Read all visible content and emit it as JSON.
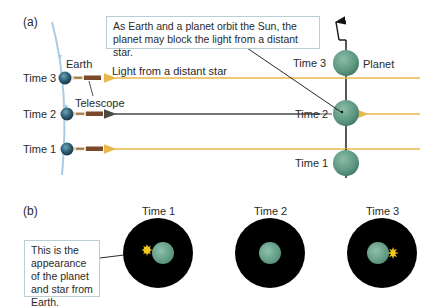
{
  "panels": {
    "a": {
      "label": "(a)",
      "callout": "As Earth and a planet orbit the Sun, the planet may block the light from a distant star.",
      "earth_label": "Earth",
      "telescope_label": "Telescope",
      "light_label": "Light from a distant star",
      "planet_label": "Planet",
      "earth_times": [
        "Time 3",
        "Time 2",
        "Time 1"
      ],
      "planet_times": [
        "Time 3",
        "Time 2",
        "Time 1"
      ]
    },
    "b": {
      "label": "(b)",
      "callout": "This is the appearance of the planet and star from Earth.",
      "views": [
        {
          "time": "Time 1",
          "star_position": "left"
        },
        {
          "time": "Time 2",
          "star_position": "hidden"
        },
        {
          "time": "Time 3",
          "star_position": "right"
        }
      ]
    }
  },
  "colors": {
    "light_ray": "#e8b84a",
    "blocked_ray": "#5a5a52",
    "earth_orbit": "#a9cde6",
    "planet": "#5f9a84",
    "planet_orbit": "#1a1a1a",
    "view_disc": "#000000",
    "star": "#f2c81e",
    "callout_border": "#b9cfd6"
  }
}
